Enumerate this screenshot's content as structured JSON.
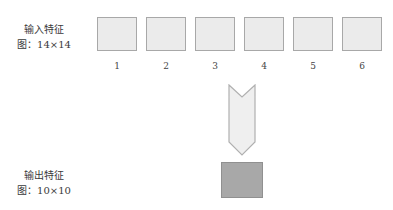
{
  "input": {
    "title": "输入特征",
    "subtitle": "图：14×14",
    "maps": [
      {
        "label": "1"
      },
      {
        "label": "2"
      },
      {
        "label": "3"
      },
      {
        "label": "4"
      },
      {
        "label": "5"
      },
      {
        "label": "6"
      }
    ]
  },
  "output": {
    "title": "输出特征",
    "subtitle": "图：10×10"
  },
  "colors": {
    "input_fill": "#ebebeb",
    "input_border": "#a8a8a8",
    "arrow_fill": "#efefef",
    "arrow_border": "#b0b0b0",
    "output_fill": "#a8a8a8"
  }
}
